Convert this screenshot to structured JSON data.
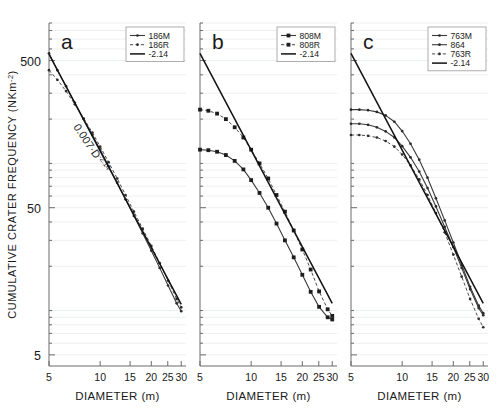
{
  "figure": {
    "axis_x_title": "DIAMETER (m)",
    "axis_y_title": "CUMULATIVE CRATER FREQUENCY (NKm",
    "axis_y_title_sup": "-2",
    "axis_y_title_close": ")",
    "x_ticks": [
      "5",
      "10",
      "15",
      "20",
      "25",
      "30"
    ],
    "y_ticks": [
      "500",
      "50",
      "5"
    ],
    "annotation_base": "0.007·D",
    "annotation_exp": "-2.14"
  },
  "chart_data": {
    "type": "line",
    "title": "",
    "xlabel": "DIAMETER (m)",
    "ylabel": "CUMULATIVE CRATER FREQUENCY (NKm-2)",
    "xscale": "log",
    "yscale": "log",
    "xlim": [
      5,
      32
    ],
    "ylim": [
      4.2,
      900
    ],
    "xticks": [
      5,
      10,
      15,
      20,
      25,
      30
    ],
    "yticks": [
      500,
      50,
      5
    ],
    "grid": true,
    "legend_position": "top-right",
    "annotation": "0.007·D^-2.14",
    "panels": [
      {
        "label": "a",
        "legend": [
          {
            "name": "186M",
            "style": "solid-marker"
          },
          {
            "name": "186R",
            "style": "dashed-marker"
          },
          {
            "name": "-2.14",
            "style": "solid-thick"
          }
        ],
        "series": [
          {
            "name": "186M",
            "style": "solid-marker",
            "x": [
              5.0,
              5.6,
              6.3,
              7.1,
              8.0,
              9.0,
              10.0,
              11.2,
              12.6,
              14.1,
              15.8,
              17.8,
              20.0,
              22.4,
              25.1,
              28.2,
              30.0
            ],
            "y": [
              560,
              430,
              335,
              258,
              200,
              156,
              124,
              96,
              74,
              57,
              44,
              33.5,
              25.5,
              19.5,
              14.8,
              11.2,
              9.9
            ]
          },
          {
            "name": "186R",
            "style": "dashed-marker",
            "x": [
              5.0,
              5.6,
              6.3,
              7.1,
              8.0,
              9.0,
              10.0,
              11.2,
              12.6,
              14.1,
              15.8,
              17.8,
              20.0,
              22.4,
              25.1,
              28.2,
              30.0
            ],
            "y": [
              430,
              370,
              310,
              252,
              202,
              162,
              130,
              102,
              79,
              61,
              47,
              36,
              27.5,
              21,
              16,
              12,
              10.5
            ]
          },
          {
            "name": "-2.14",
            "style": "solid-thick",
            "x": [
              5.0,
              30.0
            ],
            "y": [
              552,
              11.0
            ]
          }
        ]
      },
      {
        "label": "b",
        "legend": [
          {
            "name": "808M",
            "style": "solid-marker"
          },
          {
            "name": "808R",
            "style": "dashed-marker"
          },
          {
            "name": "-2.14",
            "style": "solid-thick"
          }
        ],
        "series": [
          {
            "name": "808R",
            "style": "dashed-marker",
            "x": [
              5.0,
              5.6,
              6.3,
              7.1,
              8.0,
              9.0,
              10.0,
              11.2,
              12.6,
              14.1,
              15.8,
              17.8,
              20.0,
              22.4,
              25.1,
              28.2,
              30.0
            ],
            "y": [
              232,
              228,
              218,
              200,
              176,
              150,
              124,
              100,
              79,
              61,
              47,
              35,
              26,
              19,
              13.5,
              10.2,
              9.2
            ]
          },
          {
            "name": "808M",
            "style": "solid-marker",
            "x": [
              5.0,
              5.6,
              6.3,
              7.1,
              8.0,
              9.0,
              10.0,
              11.2,
              12.6,
              14.1,
              15.8,
              17.8,
              20.0,
              22.4,
              25.1,
              28.2,
              30.0
            ],
            "y": [
              124,
              123,
              120,
              114,
              104,
              91,
              77,
              63,
              50,
              39,
              30,
              23,
              17.5,
              13.4,
              10.6,
              9.0,
              8.7
            ]
          },
          {
            "name": "-2.14",
            "style": "solid-thick",
            "x": [
              5.0,
              30.0
            ],
            "y": [
              560,
              11.2
            ]
          }
        ]
      },
      {
        "label": "c",
        "legend": [
          {
            "name": "763M",
            "style": "solid-marker"
          },
          {
            "name": "864",
            "style": "solid-marker2"
          },
          {
            "name": "763R",
            "style": "dashed-marker"
          },
          {
            "name": "-2.14",
            "style": "solid-thick"
          }
        ],
        "series": [
          {
            "name": "763M",
            "style": "solid-marker",
            "x": [
              5.0,
              5.6,
              6.3,
              7.1,
              8.0,
              9.0,
              10.0,
              11.2,
              12.6,
              14.1,
              15.8,
              17.8,
              20.0,
              22.4,
              25.1,
              28.2,
              30.0
            ],
            "y": [
              232,
              232,
              230,
              224,
              212,
              192,
              166,
              136,
              106,
              80,
              58,
              41,
              29,
              20.5,
              14.5,
              10.8,
              9.6
            ]
          },
          {
            "name": "864",
            "style": "solid-marker2",
            "x": [
              5.0,
              5.6,
              6.3,
              7.1,
              8.0,
              9.0,
              10.0,
              11.2,
              12.6,
              14.1,
              15.8,
              17.8,
              20.0,
              22.4,
              25.1,
              28.2,
              30.0
            ],
            "y": [
              186,
              186,
              183,
              176,
              165,
              150,
              131,
              110,
              88,
              68,
              51,
              37,
              27,
              19.5,
              14.0,
              10.4,
              9.3
            ]
          },
          {
            "name": "763R",
            "style": "dashed-marker",
            "x": [
              5.0,
              5.6,
              6.3,
              7.1,
              8.0,
              9.0,
              10.0,
              11.2,
              12.6,
              14.1,
              15.8,
              17.8,
              20.0,
              22.4,
              25.1,
              28.2,
              30.0
            ],
            "y": [
              156,
              156,
              154,
              150,
              142,
              130,
              115,
              97,
              78,
              61,
              46,
              34,
              24,
              17,
              12,
              8.8,
              7.7
            ]
          },
          {
            "name": "-2.14",
            "style": "solid-thick",
            "x": [
              5.0,
              30.0
            ],
            "y": [
              560,
              11.2
            ]
          }
        ]
      }
    ]
  }
}
